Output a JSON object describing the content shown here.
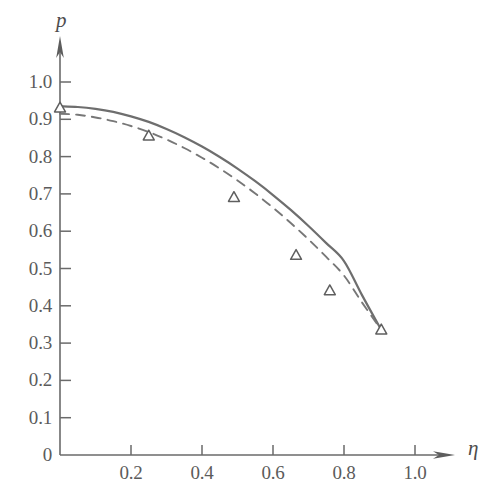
{
  "chart_data": {
    "type": "line",
    "title": "",
    "subtitle": "",
    "xlabel": "η",
    "ylabel": "p",
    "xlim": [
      0,
      1.12
    ],
    "ylim": [
      0,
      1.11
    ],
    "grid": false,
    "legend": "none",
    "x_ticks": [
      {
        "value": 0.2,
        "label": "0.2"
      },
      {
        "value": 0.4,
        "label": "0.4"
      },
      {
        "value": 0.6,
        "label": "0.6"
      },
      {
        "value": 0.8,
        "label": "0.8"
      },
      {
        "value": 1.0,
        "label": "1.0"
      }
    ],
    "y_ticks": [
      {
        "value": 0,
        "label": "0"
      },
      {
        "value": 0.1,
        "label": "0.1"
      },
      {
        "value": 0.2,
        "label": "0.2"
      },
      {
        "value": 0.3,
        "label": "0.3"
      },
      {
        "value": 0.4,
        "label": "0.4"
      },
      {
        "value": 0.5,
        "label": "0.5"
      },
      {
        "value": 0.6,
        "label": "0.6"
      },
      {
        "value": 0.7,
        "label": "0.7"
      },
      {
        "value": 0.8,
        "label": "0.8"
      },
      {
        "value": 0.9,
        "label": "0.9"
      },
      {
        "value": 1.0,
        "label": "1.0"
      }
    ],
    "series": [
      {
        "name": "solid-curve",
        "style": "solid",
        "color": "#6e6e6e",
        "markers": "none",
        "x": [
          0.0,
          0.05,
          0.1,
          0.15,
          0.2,
          0.25,
          0.3,
          0.35,
          0.4,
          0.45,
          0.5,
          0.55,
          0.6,
          0.65,
          0.7,
          0.75,
          0.8,
          0.85,
          0.905
        ],
        "y": [
          0.935,
          0.933,
          0.928,
          0.92,
          0.908,
          0.893,
          0.874,
          0.852,
          0.827,
          0.799,
          0.768,
          0.734,
          0.697,
          0.657,
          0.614,
          0.568,
          0.52,
          0.43,
          0.335
        ]
      },
      {
        "name": "dashed-curve",
        "style": "dashed",
        "color": "#777777",
        "markers": "open-triangle",
        "x": [
          0.0,
          0.05,
          0.1,
          0.15,
          0.2,
          0.25,
          0.3,
          0.35,
          0.4,
          0.45,
          0.5,
          0.55,
          0.6,
          0.65,
          0.7,
          0.75,
          0.8,
          0.85,
          0.905
        ],
        "y": [
          0.915,
          0.912,
          0.905,
          0.895,
          0.882,
          0.866,
          0.846,
          0.823,
          0.797,
          0.768,
          0.736,
          0.701,
          0.663,
          0.622,
          0.578,
          0.531,
          0.481,
          0.41,
          0.335
        ]
      }
    ],
    "data_points": [
      {
        "x": 0.0,
        "y": 0.93
      },
      {
        "x": 0.25,
        "y": 0.855
      },
      {
        "x": 0.49,
        "y": 0.69
      },
      {
        "x": 0.665,
        "y": 0.535
      },
      {
        "x": 0.76,
        "y": 0.44
      },
      {
        "x": 0.905,
        "y": 0.335
      }
    ],
    "axes": {
      "x_arrow": true,
      "y_arrow": true,
      "origin_label": "0"
    }
  }
}
